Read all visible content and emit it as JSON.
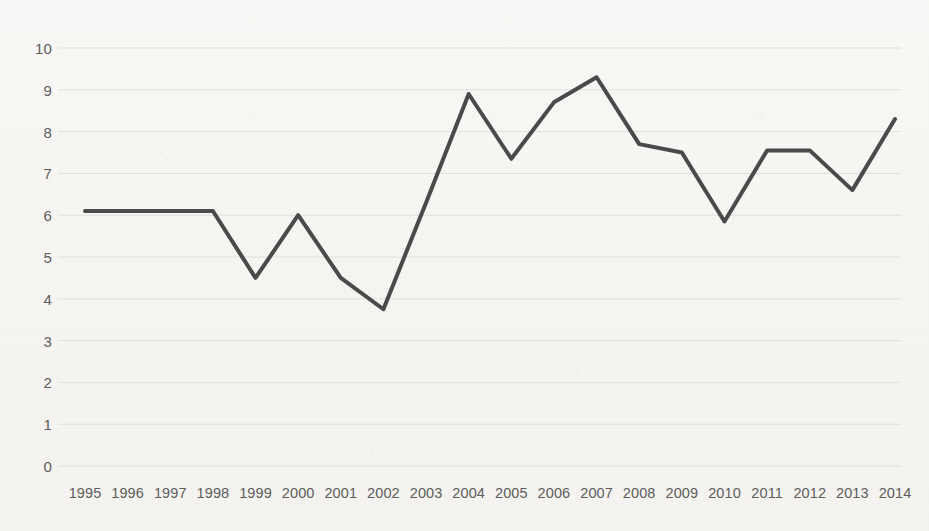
{
  "chart_data": {
    "type": "line",
    "title": "",
    "subtitle": "",
    "xlabel": "",
    "ylabel": "",
    "grid": true,
    "grid_axis": "y",
    "legend": false,
    "legend_position": "none",
    "xlim": [
      1995,
      2014
    ],
    "ylim": [
      0,
      10
    ],
    "y_ticks": [
      10,
      9,
      8,
      7,
      6,
      5,
      4,
      3,
      2,
      1,
      0
    ],
    "x": [
      1995,
      1996,
      1997,
      1998,
      1999,
      2000,
      2001,
      2002,
      2003,
      2004,
      2005,
      2006,
      2007,
      2008,
      2009,
      2010,
      2011,
      2012,
      2013,
      2014
    ],
    "categories": [
      "1995",
      "1996",
      "1997",
      "1998",
      "1999",
      "2000",
      "2001",
      "2002",
      "2003",
      "2004",
      "2005",
      "2006",
      "2007",
      "2008",
      "2009",
      "2010",
      "2011",
      "2012",
      "2013",
      "2014"
    ],
    "series": [
      {
        "name": "",
        "color": "#4a4a4a",
        "line_width": 4,
        "markers": false,
        "values": [
          6.1,
          6.1,
          6.1,
          6.1,
          4.5,
          6.0,
          4.5,
          3.75,
          6.3,
          8.9,
          7.35,
          8.7,
          9.3,
          7.7,
          7.5,
          5.85,
          7.55,
          7.55,
          6.6,
          8.3
        ]
      }
    ]
  },
  "style": {
    "background_color": "#f7f6f3",
    "grid_color": "#e2e0dc",
    "tick_label_color": "#5d5d5d",
    "line_color": "#4a4a4a"
  }
}
